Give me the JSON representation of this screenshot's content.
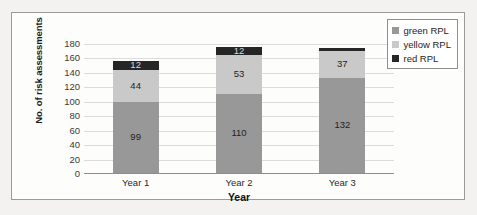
{
  "chart_data": {
    "type": "bar",
    "subtype": "stacked-bar",
    "title": "",
    "xlabel": "Year",
    "ylabel": "No. of risk assessments",
    "categories": [
      "Year 1",
      "Year 2",
      "Year 3"
    ],
    "ylim": [
      0,
      180
    ],
    "yticks": [
      0,
      20,
      40,
      60,
      80,
      100,
      120,
      140,
      160,
      180
    ],
    "grid": true,
    "legend_position": "top-right",
    "series": [
      {
        "name": "green RPL",
        "color": "#989898",
        "values": [
          99,
          110,
          132
        ],
        "labels": [
          "99",
          "110",
          "132"
        ]
      },
      {
        "name": "yellow RPL",
        "color": "#c9c9c9",
        "values": [
          44,
          53,
          37
        ],
        "labels": [
          "44",
          "53",
          "37"
        ]
      },
      {
        "name": "red RPL",
        "color": "#262626",
        "values": [
          12,
          12,
          4
        ],
        "labels": [
          "12",
          "12",
          ""
        ]
      }
    ],
    "totals": [
      155,
      175,
      173
    ]
  },
  "axis": {
    "y_title": "No. of risk assessments",
    "x_title": "Year",
    "y_tick_labels": [
      "180",
      "160",
      "140",
      "120",
      "100",
      "80",
      "60",
      "40",
      "20",
      "0"
    ],
    "x_tick_labels": [
      "Year 1",
      "Year 2",
      "Year 3"
    ]
  },
  "legend": {
    "items": [
      {
        "label": "green RPL",
        "color": "#989898"
      },
      {
        "label": "yellow RPL",
        "color": "#c9c9c9"
      },
      {
        "label": "red RPL",
        "color": "#262626"
      }
    ]
  },
  "colors": {
    "green_rpl": "#989898",
    "yellow_rpl": "#c9c9c9",
    "red_rpl": "#262626",
    "gridline": "#dcdcdc",
    "axis": "#8d8d8d",
    "frame": "#9a9a9a",
    "plot_background": "#fdfdfc",
    "page_background": "#f3f2f0"
  }
}
